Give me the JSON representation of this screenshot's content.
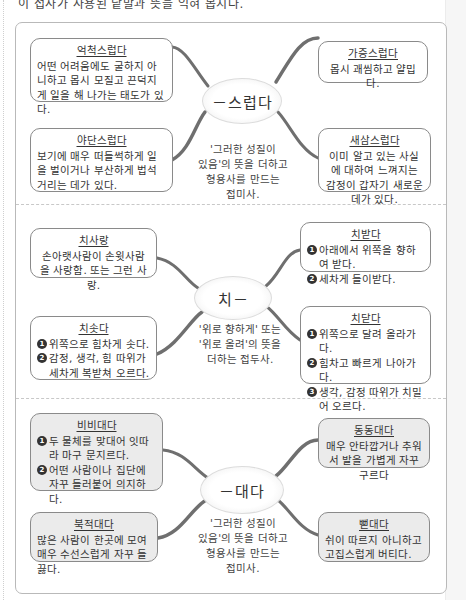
{
  "top_text": "이 접사가 사용된 낱말과 뜻을 익혀 봅시다.",
  "sections": [
    {
      "hub": "－스럽다",
      "description": [
        "'그러한 성질이",
        "있음'의 뜻을 더하고",
        "형용사를 만드는",
        "접미사."
      ],
      "cards": [
        {
          "id": "eokcheok",
          "title": "억척스럽다",
          "body": "어떤 어려움에도 굴하지 아니하고 몹시 모질고 끈덕지게 일을 해 나가는 태도가 있다."
        },
        {
          "id": "yadan",
          "title": "야단스럽다",
          "body": "보기에 매우 떠들썩하게 일을 벌이거나 부산하게 법석거리는 데가 있다."
        },
        {
          "id": "gajeung",
          "title": "가증스럽다",
          "body": "몹시 괘씸하고 얄밉다."
        },
        {
          "id": "saesam",
          "title": "새삼스럽다",
          "body": "이미 알고 있는 사실에 대하여 느껴지는 감정이 갑자기 새로운 데가 있다."
        }
      ]
    },
    {
      "hub": "치－",
      "description": [
        "'위로 향하게' 또는",
        "'위로 올려'의 뜻을",
        "더하는 접두사."
      ],
      "cards": [
        {
          "id": "chisarang",
          "title": "치사랑",
          "body": "손아랫사람이 손윗사람을 사랑함. 또는 그런 사랑."
        },
        {
          "id": "chisotda",
          "title": "치솟다",
          "items": [
            "위쪽으로 힘차게 솟다.",
            "감정, 생각, 힘 따위가 세차게 복받쳐 오르다."
          ]
        },
        {
          "id": "chibatda",
          "title": "치받다",
          "items": [
            "아래에서 위쪽을 향하여 받다.",
            "세차게 들이받다."
          ]
        },
        {
          "id": "chidatda",
          "title": "치닫다",
          "items": [
            "위쪽으로 달려 올라가다.",
            "힘차고 빠르게 나아가다.",
            "생각, 감정 따위가 치밀어 오르다."
          ]
        }
      ]
    },
    {
      "hub": "－대다",
      "description": [
        "'그러한 성질이",
        "있음'의 뜻을 더하고",
        "형용사를 만드는",
        "접미사."
      ],
      "cards": [
        {
          "id": "bibidaeda",
          "title": "비비대다",
          "items": [
            "두 물체를 맞대어 잇따라 마구 문지르다.",
            "어떤 사람이나 집단에 자꾸 들러붙어 의지하다."
          ]
        },
        {
          "id": "bukjeokdaeda",
          "title": "북적대다",
          "body": "많은 사람이 한곳에 모여 매우 수선스럽게 자꾸 들끓다."
        },
        {
          "id": "dongdongdaeda",
          "title": "동동대다",
          "body": "매우 안타깝거나 추워서 발을 가볍게 자꾸 구르다"
        },
        {
          "id": "ppaeddaeda",
          "title": "뻗대다",
          "body": "쉬이 따르지 아니하고 고집스럽게 버티다."
        }
      ]
    }
  ],
  "number_glyphs": [
    "1",
    "2",
    "3"
  ],
  "colors": {
    "card_border": "#8a8a8a",
    "gray_card_bg": "#ebebeb",
    "branch": "#6f6f6f"
  }
}
